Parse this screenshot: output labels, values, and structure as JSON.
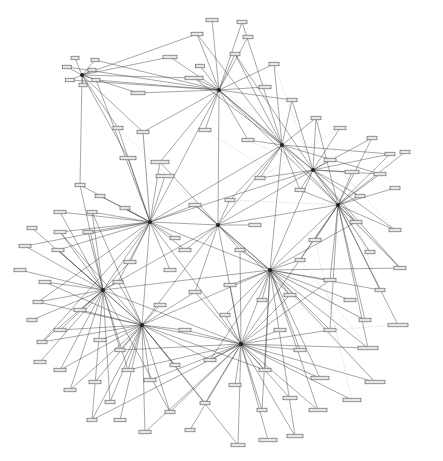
{
  "diagram": {
    "type": "network-graph",
    "background": "#ffffff",
    "edge_color": "#3a3a3a",
    "faint_edge_color": "#b8b8b8",
    "node_fill": "#e6e6e6",
    "node_stroke": "#555555",
    "hubs": [
      {
        "id": "h1",
        "x": 219,
        "y": 90
      },
      {
        "id": "h2",
        "x": 282,
        "y": 145
      },
      {
        "id": "h3",
        "x": 313,
        "y": 170
      },
      {
        "id": "h4",
        "x": 150,
        "y": 222
      },
      {
        "id": "h5",
        "x": 218,
        "y": 225
      },
      {
        "id": "h6",
        "x": 103,
        "y": 290
      },
      {
        "id": "h7",
        "x": 142,
        "y": 325
      },
      {
        "id": "h8",
        "x": 241,
        "y": 344
      },
      {
        "id": "h9",
        "x": 270,
        "y": 270
      },
      {
        "id": "h10",
        "x": 338,
        "y": 205
      },
      {
        "id": "h11",
        "x": 82,
        "y": 75
      }
    ],
    "nodes": [
      {
        "x": 212,
        "y": 20,
        "w": 12
      },
      {
        "x": 242,
        "y": 22,
        "w": 10
      },
      {
        "x": 197,
        "y": 34,
        "w": 12
      },
      {
        "x": 248,
        "y": 37,
        "w": 10
      },
      {
        "x": 170,
        "y": 57,
        "w": 14
      },
      {
        "x": 235,
        "y": 54,
        "w": 10
      },
      {
        "x": 200,
        "y": 66,
        "w": 9
      },
      {
        "x": 274,
        "y": 64,
        "w": 10
      },
      {
        "x": 194,
        "y": 78,
        "w": 18
      },
      {
        "x": 265,
        "y": 87,
        "w": 12
      },
      {
        "x": 138,
        "y": 93,
        "w": 14
      },
      {
        "x": 292,
        "y": 100,
        "w": 10
      },
      {
        "x": 75,
        "y": 58,
        "w": 8
      },
      {
        "x": 95,
        "y": 60,
        "w": 8
      },
      {
        "x": 67,
        "y": 67,
        "w": 9
      },
      {
        "x": 92,
        "y": 70,
        "w": 8
      },
      {
        "x": 70,
        "y": 80,
        "w": 9
      },
      {
        "x": 96,
        "y": 80,
        "w": 8
      },
      {
        "x": 83,
        "y": 85,
        "w": 8
      },
      {
        "x": 118,
        "y": 128,
        "w": 10
      },
      {
        "x": 143,
        "y": 132,
        "w": 12
      },
      {
        "x": 205,
        "y": 130,
        "w": 12
      },
      {
        "x": 248,
        "y": 140,
        "w": 12
      },
      {
        "x": 160,
        "y": 162,
        "w": 18
      },
      {
        "x": 165,
        "y": 176,
        "w": 18
      },
      {
        "x": 128,
        "y": 158,
        "w": 16
      },
      {
        "x": 316,
        "y": 118,
        "w": 10
      },
      {
        "x": 340,
        "y": 128,
        "w": 12
      },
      {
        "x": 372,
        "y": 138,
        "w": 10
      },
      {
        "x": 390,
        "y": 154,
        "w": 10
      },
      {
        "x": 405,
        "y": 152,
        "w": 10
      },
      {
        "x": 352,
        "y": 172,
        "w": 14
      },
      {
        "x": 380,
        "y": 174,
        "w": 12
      },
      {
        "x": 395,
        "y": 188,
        "w": 10
      },
      {
        "x": 360,
        "y": 196,
        "w": 10
      },
      {
        "x": 300,
        "y": 190,
        "w": 10
      },
      {
        "x": 330,
        "y": 160,
        "w": 12
      },
      {
        "x": 260,
        "y": 178,
        "w": 10
      },
      {
        "x": 80,
        "y": 185,
        "w": 10
      },
      {
        "x": 100,
        "y": 196,
        "w": 10
      },
      {
        "x": 60,
        "y": 212,
        "w": 12
      },
      {
        "x": 92,
        "y": 212,
        "w": 10
      },
      {
        "x": 125,
        "y": 208,
        "w": 10
      },
      {
        "x": 88,
        "y": 232,
        "w": 10
      },
      {
        "x": 60,
        "y": 232,
        "w": 12
      },
      {
        "x": 32,
        "y": 228,
        "w": 10
      },
      {
        "x": 25,
        "y": 246,
        "w": 12
      },
      {
        "x": 58,
        "y": 250,
        "w": 12
      },
      {
        "x": 20,
        "y": 270,
        "w": 12
      },
      {
        "x": 45,
        "y": 282,
        "w": 12
      },
      {
        "x": 38,
        "y": 302,
        "w": 10
      },
      {
        "x": 32,
        "y": 320,
        "w": 10
      },
      {
        "x": 60,
        "y": 330,
        "w": 12
      },
      {
        "x": 42,
        "y": 342,
        "w": 10
      },
      {
        "x": 40,
        "y": 362,
        "w": 12
      },
      {
        "x": 60,
        "y": 370,
        "w": 12
      },
      {
        "x": 70,
        "y": 390,
        "w": 12
      },
      {
        "x": 95,
        "y": 382,
        "w": 12
      },
      {
        "x": 110,
        "y": 402,
        "w": 10
      },
      {
        "x": 92,
        "y": 420,
        "w": 10
      },
      {
        "x": 120,
        "y": 420,
        "w": 12
      },
      {
        "x": 145,
        "y": 432,
        "w": 12
      },
      {
        "x": 170,
        "y": 412,
        "w": 10
      },
      {
        "x": 190,
        "y": 430,
        "w": 10
      },
      {
        "x": 205,
        "y": 403,
        "w": 10
      },
      {
        "x": 238,
        "y": 445,
        "w": 14
      },
      {
        "x": 268,
        "y": 440,
        "w": 18
      },
      {
        "x": 295,
        "y": 436,
        "w": 16
      },
      {
        "x": 318,
        "y": 410,
        "w": 18
      },
      {
        "x": 352,
        "y": 400,
        "w": 18
      },
      {
        "x": 375,
        "y": 382,
        "w": 20
      },
      {
        "x": 368,
        "y": 348,
        "w": 20
      },
      {
        "x": 398,
        "y": 325,
        "w": 20
      },
      {
        "x": 365,
        "y": 320,
        "w": 12
      },
      {
        "x": 320,
        "y": 378,
        "w": 18
      },
      {
        "x": 290,
        "y": 398,
        "w": 14
      },
      {
        "x": 262,
        "y": 410,
        "w": 10
      },
      {
        "x": 330,
        "y": 330,
        "w": 12
      },
      {
        "x": 350,
        "y": 300,
        "w": 12
      },
      {
        "x": 380,
        "y": 290,
        "w": 10
      },
      {
        "x": 400,
        "y": 268,
        "w": 12
      },
      {
        "x": 370,
        "y": 252,
        "w": 10
      },
      {
        "x": 395,
        "y": 230,
        "w": 12
      },
      {
        "x": 356,
        "y": 222,
        "w": 12
      },
      {
        "x": 315,
        "y": 240,
        "w": 12
      },
      {
        "x": 300,
        "y": 260,
        "w": 10
      },
      {
        "x": 290,
        "y": 295,
        "w": 12
      },
      {
        "x": 262,
        "y": 300,
        "w": 10
      },
      {
        "x": 230,
        "y": 285,
        "w": 12
      },
      {
        "x": 195,
        "y": 292,
        "w": 12
      },
      {
        "x": 170,
        "y": 270,
        "w": 12
      },
      {
        "x": 185,
        "y": 250,
        "w": 12
      },
      {
        "x": 240,
        "y": 250,
        "w": 10
      },
      {
        "x": 255,
        "y": 225,
        "w": 12
      },
      {
        "x": 230,
        "y": 200,
        "w": 10
      },
      {
        "x": 195,
        "y": 205,
        "w": 12
      },
      {
        "x": 175,
        "y": 238,
        "w": 10
      },
      {
        "x": 130,
        "y": 262,
        "w": 12
      },
      {
        "x": 118,
        "y": 282,
        "w": 10
      },
      {
        "x": 160,
        "y": 305,
        "w": 12
      },
      {
        "x": 185,
        "y": 330,
        "w": 12
      },
      {
        "x": 210,
        "y": 360,
        "w": 12
      },
      {
        "x": 175,
        "y": 365,
        "w": 10
      },
      {
        "x": 150,
        "y": 380,
        "w": 12
      },
      {
        "x": 120,
        "y": 350,
        "w": 10
      },
      {
        "x": 100,
        "y": 340,
        "w": 12
      },
      {
        "x": 80,
        "y": 310,
        "w": 12
      },
      {
        "x": 128,
        "y": 370,
        "w": 12
      },
      {
        "x": 280,
        "y": 330,
        "w": 12
      },
      {
        "x": 300,
        "y": 350,
        "w": 12
      },
      {
        "x": 265,
        "y": 370,
        "w": 12
      },
      {
        "x": 235,
        "y": 385,
        "w": 12
      },
      {
        "x": 225,
        "y": 315,
        "w": 10
      },
      {
        "x": 330,
        "y": 280,
        "w": 12
      }
    ],
    "faint_edges": [
      [
        219,
        90,
        282,
        145
      ],
      [
        205,
        130,
        300,
        190
      ],
      [
        260,
        178,
        340,
        128
      ],
      [
        248,
        140,
        313,
        170
      ],
      [
        230,
        200,
        338,
        205
      ],
      [
        282,
        145,
        400,
        268
      ],
      [
        313,
        170,
        370,
        252
      ],
      [
        300,
        260,
        368,
        348
      ],
      [
        330,
        330,
        398,
        325
      ],
      [
        290,
        295,
        375,
        382
      ],
      [
        315,
        240,
        352,
        400
      ],
      [
        241,
        344,
        320,
        378
      ],
      [
        270,
        270,
        365,
        320
      ],
      [
        118,
        128,
        218,
        225
      ],
      [
        143,
        132,
        150,
        222
      ],
      [
        200,
        66,
        282,
        145
      ],
      [
        274,
        64,
        313,
        170
      ],
      [
        330,
        160,
        395,
        230
      ],
      [
        356,
        222,
        380,
        290
      ],
      [
        338,
        205,
        400,
        268
      ]
    ]
  }
}
